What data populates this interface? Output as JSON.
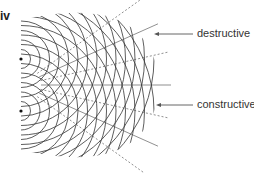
{
  "panel": {
    "label": "iv"
  },
  "sources": [
    {
      "name": "source-top",
      "x": 21,
      "y": 59
    },
    {
      "name": "source-bottom",
      "x": 21,
      "y": 111
    }
  ],
  "wave": {
    "spacing": 9.5,
    "rings": 14,
    "color": "#333333"
  },
  "annotations": {
    "destructive": {
      "label": "destructive",
      "arrow_y": 34
    },
    "constructive": {
      "label": "constructive",
      "arrow_y": 105
    }
  }
}
